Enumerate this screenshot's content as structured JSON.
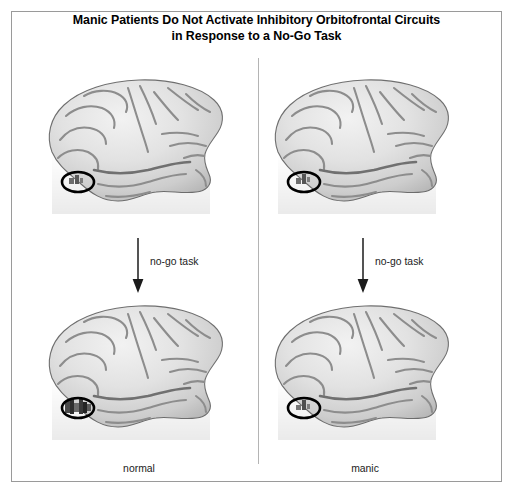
{
  "figure": {
    "title_line_1": "Manic Patients Do Not Activate Inhibitory Orbitofrontal Circuits",
    "title_line_2": "in Response to a No-Go Task",
    "background_color": "#ffffff",
    "frame_color": "#9a9a9a",
    "divider_color": "#b4b4b4"
  },
  "columns": [
    {
      "id": "normal",
      "label": "normal"
    },
    {
      "id": "manic",
      "label": "manic"
    }
  ],
  "arrows": [
    {
      "id": "arrow-left",
      "label": "no-go task",
      "direction": "down"
    },
    {
      "id": "arrow-right",
      "label": "no-go task",
      "direction": "down"
    }
  ],
  "brains": [
    {
      "id": "top-left",
      "column": "normal",
      "row": "baseline",
      "view": "left-lateral",
      "marker": {
        "shape": "ellipse",
        "region": "orbitofrontal",
        "outline_color": "#000000"
      },
      "activation_level": "minimal"
    },
    {
      "id": "top-right",
      "column": "manic",
      "row": "baseline",
      "view": "left-lateral",
      "marker": {
        "shape": "ellipse",
        "region": "orbitofrontal",
        "outline_color": "#000000"
      },
      "activation_level": "minimal"
    },
    {
      "id": "bottom-left",
      "column": "normal",
      "row": "after-no-go-task",
      "view": "left-lateral",
      "marker": {
        "shape": "ellipse",
        "region": "orbitofrontal",
        "outline_color": "#000000"
      },
      "activation_level": "strong"
    },
    {
      "id": "bottom-right",
      "column": "manic",
      "row": "after-no-go-task",
      "view": "left-lateral",
      "marker": {
        "shape": "ellipse",
        "region": "orbitofrontal",
        "outline_color": "#000000"
      },
      "activation_level": "minimal"
    }
  ],
  "icons": {
    "arrow_down": "down-arrow-icon",
    "brain": "brain-lateral-icon",
    "highlight": "ellipse-highlight-icon"
  }
}
